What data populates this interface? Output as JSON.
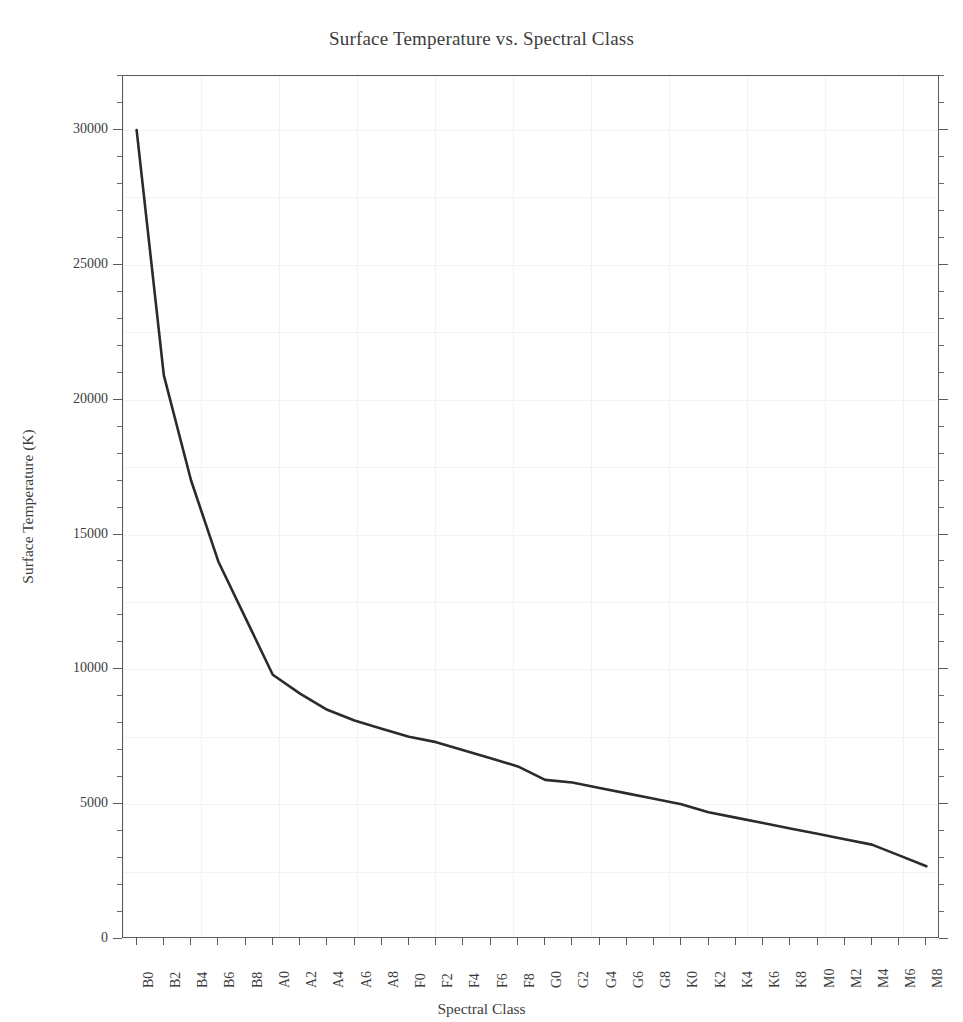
{
  "chart_data": {
    "type": "line",
    "title": "Surface Temperature vs. Spectral Class",
    "xlabel": "Spectral Class",
    "ylabel": "Surface Temperature (K)",
    "categories": [
      "B0",
      "B2",
      "B4",
      "B6",
      "B8",
      "A0",
      "A2",
      "A4",
      "A6",
      "A8",
      "F0",
      "F2",
      "F4",
      "F6",
      "F8",
      "G0",
      "G2",
      "G4",
      "G6",
      "G8",
      "K0",
      "K2",
      "K4",
      "K6",
      "K8",
      "M0",
      "M2",
      "M4",
      "M6",
      "M8"
    ],
    "values": [
      30000,
      20900,
      17000,
      14000,
      11900,
      9800,
      9100,
      8500,
      8100,
      7800,
      7500,
      7300,
      7000,
      6700,
      6400,
      5900,
      5800,
      5600,
      5400,
      5200,
      5000,
      4700,
      4500,
      4300,
      4100,
      3900,
      3700,
      3500,
      3100,
      2700
    ],
    "ylim": [
      0,
      32000
    ],
    "y_ticks_major": [
      0,
      5000,
      10000,
      15000,
      20000,
      25000,
      30000
    ],
    "y_tick_labels": [
      "0",
      "5000",
      "10000",
      "15000",
      "20000",
      "25000",
      "30000"
    ],
    "y_minor_interval": 1000,
    "grid": true,
    "legend": "none",
    "line_color": "#2b2b2b",
    "line_width": 2.6,
    "markers": "none",
    "background_color": "#ffffff",
    "frame_color": "#5a5a5a",
    "grid_color": "#f2f2f4"
  },
  "axes": {
    "y_label_text": "Surface Temperature (K)",
    "x_label_text": "Spectral Class"
  }
}
